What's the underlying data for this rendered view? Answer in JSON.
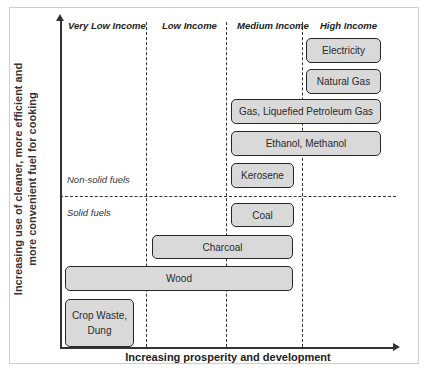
{
  "diagram": {
    "y_axis_label_line1": "Increasing use of cleaner, more efficient and",
    "y_axis_label_line2": "more convenient fuel for cooking",
    "x_axis_label": "Increasing prosperity and development",
    "columns": [
      {
        "label": "Very Low Income"
      },
      {
        "label": "Low Income"
      },
      {
        "label": "Medium Income"
      },
      {
        "label": "High Income"
      }
    ],
    "zones": {
      "upper": "Non-solid fuels",
      "lower": "Solid fuels"
    },
    "fuels": [
      {
        "label": "Electricity",
        "spans": [
          "High Income"
        ]
      },
      {
        "label": "Natural Gas",
        "spans": [
          "High Income"
        ]
      },
      {
        "label": "Gas, Liquefied Petroleum Gas",
        "spans": [
          "Medium Income",
          "High Income"
        ]
      },
      {
        "label": "Ethanol, Methanol",
        "spans": [
          "Medium Income",
          "High Income"
        ]
      },
      {
        "label": "Kerosene",
        "spans": [
          "Medium Income"
        ]
      },
      {
        "label": "Coal",
        "spans": [
          "Medium Income"
        ]
      },
      {
        "label": "Charcoal",
        "spans": [
          "Low Income",
          "Medium Income"
        ]
      },
      {
        "label": "Wood",
        "spans": [
          "Very Low Income",
          "Low Income",
          "Medium Income"
        ]
      },
      {
        "label": "Crop Waste, Dung",
        "label_line1": "Crop Waste,",
        "label_line2": "Dung",
        "spans": [
          "Very Low Income"
        ]
      }
    ],
    "colors": {
      "box_fill": "#d9d9d9",
      "box_border": "#262626",
      "axis": "#333333"
    }
  }
}
